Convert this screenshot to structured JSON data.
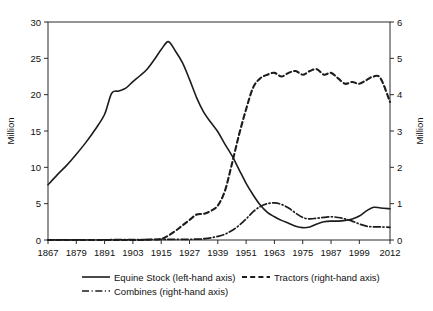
{
  "chart_data": {
    "type": "line",
    "title": "",
    "subtitle": "",
    "xlabel": "",
    "ylabel": "Million",
    "y2label": "Million",
    "xlim": [
      1867,
      2012
    ],
    "ylim": [
      0,
      30
    ],
    "y2lim": [
      0,
      6
    ],
    "grid": false,
    "legend_position": "bottom",
    "x_ticks": [
      1867,
      1879,
      1891,
      1903,
      1915,
      1927,
      1939,
      1951,
      1963,
      1975,
      1987,
      1999,
      2012
    ],
    "x_tick_labels": [
      "1867",
      "1879",
      "1891",
      "1903",
      "1915",
      "1927",
      "1939",
      "1951",
      "1963",
      "1975",
      "1987",
      "1999",
      "2012"
    ],
    "y_ticks": [
      0,
      5,
      10,
      15,
      20,
      25,
      30
    ],
    "y_tick_labels": [
      "0",
      "5",
      "10",
      "15",
      "20",
      "25",
      "30"
    ],
    "y2_ticks": [
      0,
      1,
      2,
      3,
      4,
      5,
      6
    ],
    "y2_tick_labels": [
      "0",
      "1",
      "2",
      "3",
      "4",
      "5",
      "6"
    ],
    "series": [
      {
        "name": "Equine Stock (left-hand axis)",
        "axis": "left",
        "style": "solid",
        "x": [
          1867,
          1871,
          1875,
          1879,
          1883,
          1887,
          1891,
          1894,
          1897,
          1900,
          1903,
          1906,
          1909,
          1912,
          1915,
          1918,
          1921,
          1924,
          1927,
          1930,
          1933,
          1936,
          1939,
          1942,
          1945,
          1948,
          1951,
          1954,
          1957,
          1960,
          1963,
          1966,
          1969,
          1972,
          1975,
          1978,
          1981,
          1984,
          1987,
          1990,
          1993,
          1996,
          1999,
          2002,
          2005,
          2008,
          2012
        ],
        "y": [
          7.6,
          9.0,
          10.3,
          11.8,
          13.4,
          15.2,
          17.3,
          20.2,
          20.5,
          20.9,
          21.8,
          22.6,
          23.5,
          24.8,
          26.2,
          27.3,
          26.0,
          24.4,
          22.1,
          19.6,
          17.6,
          16.2,
          14.9,
          13.2,
          11.6,
          9.7,
          7.8,
          6.2,
          4.8,
          3.8,
          3.2,
          2.7,
          2.3,
          1.9,
          1.7,
          1.8,
          2.2,
          2.5,
          2.6,
          2.6,
          2.7,
          2.9,
          3.3,
          4.0,
          4.5,
          4.4,
          4.3
        ]
      },
      {
        "name": "Tractors (right-hand axis)",
        "axis": "right",
        "style": "dashed",
        "x": [
          1867,
          1903,
          1910,
          1915,
          1918,
          1921,
          1924,
          1927,
          1930,
          1933,
          1936,
          1939,
          1942,
          1945,
          1948,
          1951,
          1954,
          1957,
          1960,
          1963,
          1966,
          1969,
          1972,
          1975,
          1978,
          1981,
          1984,
          1987,
          1990,
          1993,
          1996,
          1999,
          2002,
          2005,
          2008,
          2012
        ],
        "y": [
          0.0,
          0.0,
          0.01,
          0.03,
          0.12,
          0.25,
          0.4,
          0.55,
          0.7,
          0.72,
          0.8,
          0.95,
          1.35,
          2.1,
          2.9,
          3.6,
          4.2,
          4.45,
          4.55,
          4.6,
          4.5,
          4.6,
          4.65,
          4.55,
          4.65,
          4.7,
          4.55,
          4.6,
          4.45,
          4.3,
          4.35,
          4.3,
          4.4,
          4.5,
          4.45,
          3.8
        ]
      },
      {
        "name": "Combines (right-hand axis)",
        "axis": "right",
        "style": "dashdot",
        "x": [
          1867,
          1927,
          1933,
          1936,
          1939,
          1942,
          1945,
          1948,
          1951,
          1954,
          1957,
          1960,
          1963,
          1966,
          1969,
          1972,
          1975,
          1978,
          1981,
          1984,
          1987,
          1990,
          1993,
          1996,
          1999,
          2002,
          2005,
          2008,
          2012
        ],
        "y": [
          0.0,
          0.02,
          0.04,
          0.06,
          0.1,
          0.16,
          0.26,
          0.4,
          0.58,
          0.78,
          0.92,
          1.0,
          1.02,
          0.98,
          0.88,
          0.74,
          0.62,
          0.58,
          0.6,
          0.62,
          0.64,
          0.62,
          0.58,
          0.52,
          0.44,
          0.38,
          0.36,
          0.36,
          0.35
        ]
      }
    ],
    "legend": [
      {
        "label": "Equine Stock (left-hand axis)",
        "style": "solid"
      },
      {
        "label": "Tractors (right-hand axis)",
        "style": "dashed"
      },
      {
        "label": "Combines (right-hand axis)",
        "style": "dashdot"
      }
    ],
    "colors": {
      "line": "#1c1c1c",
      "axis": "#2b2b2b",
      "background": "#ffffff",
      "text": "#111111"
    }
  }
}
